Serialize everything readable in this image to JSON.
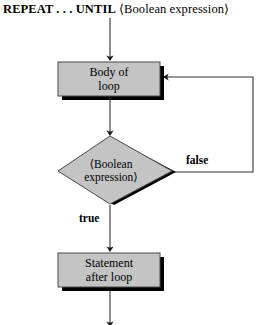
{
  "diagram": {
    "title": {
      "keyword": "REPEAT . . . UNTIL",
      "expression": "⟨Boolean expression⟩"
    },
    "nodes": {
      "body_of_loop": {
        "line1": "Body of",
        "line2": "loop",
        "shape": "process-box",
        "fill": "#c4c4c4"
      },
      "condition": {
        "line1": "⟨Boolean",
        "line2": "expression⟩",
        "shape": "decision-diamond",
        "fill": "#c4c4c4"
      },
      "statement_after_loop": {
        "line1": "Statement",
        "line2": "after loop",
        "shape": "process-box",
        "fill": "#c4c4c4"
      }
    },
    "edges": {
      "false_label": "false",
      "true_label": "true"
    },
    "colors": {
      "shape_fill": "#c4c4c4",
      "shape_stroke": "#000000",
      "shadow": "#000000",
      "line": "#333333",
      "background": "#ffffff",
      "text": "#000000"
    }
  }
}
